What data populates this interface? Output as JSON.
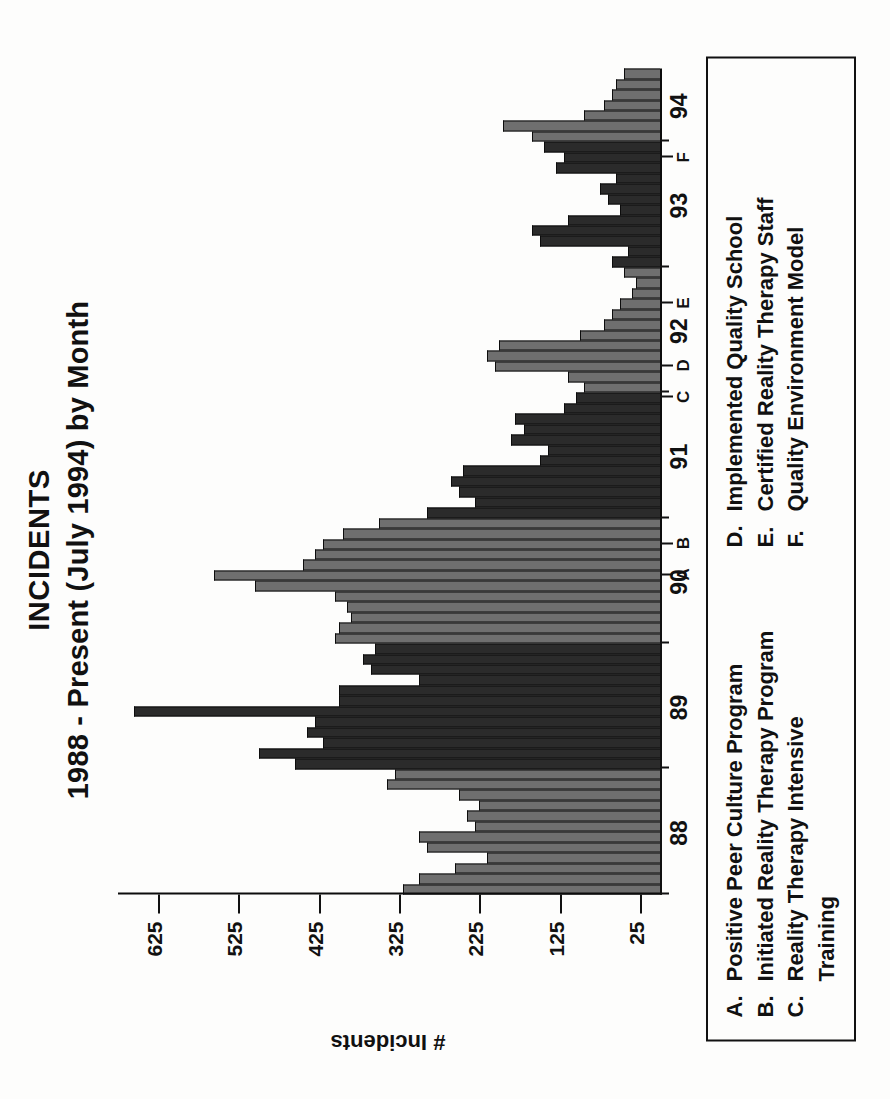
{
  "title": {
    "line1": "INCIDENTS",
    "line2": "1988 - Present (July 1994) by Month"
  },
  "axes": {
    "ylabel": "# Incidents",
    "yticks": [
      "25",
      "125",
      "225",
      "325",
      "425",
      "525",
      "625"
    ],
    "xticks": [
      "88",
      "89",
      "90",
      "91",
      "92",
      "93",
      "94"
    ]
  },
  "markers": [
    {
      "key": "A",
      "label": "A"
    },
    {
      "key": "B",
      "label": "B"
    },
    {
      "key": "C",
      "label": "C"
    },
    {
      "key": "D",
      "label": "D"
    },
    {
      "key": "E",
      "label": "E"
    },
    {
      "key": "F",
      "label": "F"
    }
  ],
  "legend": {
    "left": [
      {
        "key": "A.",
        "text": "Positive Peer Culture Program"
      },
      {
        "key": "B.",
        "text": "Initiated Reality Therapy Program"
      },
      {
        "key": "C.",
        "text": "Reality Therapy Intensive"
      }
    ],
    "left_continuation": "Training",
    "right": [
      {
        "key": "D.",
        "text": "Implemented Quality School"
      },
      {
        "key": "E.",
        "text": "Certified Reality Therapy Staff"
      },
      {
        "key": "F.",
        "text": "Quality Environment Model"
      }
    ]
  },
  "chart_data": {
    "type": "bar",
    "title": "INCIDENTS 1988 - Present (July 1994) by Month",
    "xlabel": "",
    "ylabel": "# Incidents",
    "ylim": [
      0,
      675
    ],
    "grid": false,
    "orientation": "vertical",
    "note": "Monthly incident counts, Jan 1988 through Jul 1994. Bars alternate dark/gray shading by year.",
    "categories": [
      "88-01",
      "88-02",
      "88-03",
      "88-04",
      "88-05",
      "88-06",
      "88-07",
      "88-08",
      "88-09",
      "88-10",
      "88-11",
      "88-12",
      "89-01",
      "89-02",
      "89-03",
      "89-04",
      "89-05",
      "89-06",
      "89-07",
      "89-08",
      "89-09",
      "89-10",
      "89-11",
      "89-12",
      "90-01",
      "90-02",
      "90-03",
      "90-04",
      "90-05",
      "90-06",
      "90-07",
      "90-08",
      "90-09",
      "90-10",
      "90-11",
      "90-12",
      "91-01",
      "91-02",
      "91-03",
      "91-04",
      "91-05",
      "91-06",
      "91-07",
      "91-08",
      "91-09",
      "91-10",
      "91-11",
      "91-12",
      "92-01",
      "92-02",
      "92-03",
      "92-04",
      "92-05",
      "92-06",
      "92-07",
      "92-08",
      "92-09",
      "92-10",
      "92-11",
      "92-12",
      "93-01",
      "93-02",
      "93-03",
      "93-04",
      "93-05",
      "93-06",
      "93-07",
      "93-08",
      "93-09",
      "93-10",
      "93-11",
      "93-12",
      "94-01",
      "94-02",
      "94-03",
      "94-04",
      "94-05",
      "94-06",
      "94-07"
    ],
    "values": [
      320,
      300,
      255,
      215,
      290,
      300,
      230,
      240,
      225,
      250,
      340,
      330,
      455,
      500,
      420,
      440,
      430,
      655,
      400,
      400,
      300,
      360,
      370,
      355,
      405,
      400,
      385,
      390,
      405,
      505,
      555,
      445,
      430,
      420,
      395,
      350,
      290,
      230,
      250,
      260,
      245,
      150,
      140,
      185,
      170,
      180,
      120,
      105,
      95,
      115,
      205,
      215,
      200,
      100,
      70,
      60,
      50,
      35,
      30,
      45,
      60,
      40,
      150,
      160,
      115,
      50,
      65,
      75,
      55,
      130,
      120,
      145,
      160,
      195,
      95,
      70,
      60,
      55,
      45
    ],
    "series_shading": [
      "gray",
      "dark",
      "gray",
      "dark",
      "gray",
      "dark",
      "gray"
    ],
    "annotations": [
      {
        "key": "A",
        "label": "A. Positive Peer Culture Program",
        "x": "90-07"
      },
      {
        "key": "B",
        "label": "B. Initiated Reality Therapy Program",
        "x": "90-10"
      },
      {
        "key": "C",
        "label": "C. Reality Therapy Intensive Training",
        "x": "91-12"
      },
      {
        "key": "D",
        "label": "D. Implemented Quality School",
        "x": "92-03"
      },
      {
        "key": "E",
        "label": "E. Certified Reality Therapy Staff",
        "x": "92-09"
      },
      {
        "key": "F",
        "label": "F. Quality Environment Model",
        "x": "93-11"
      }
    ]
  }
}
